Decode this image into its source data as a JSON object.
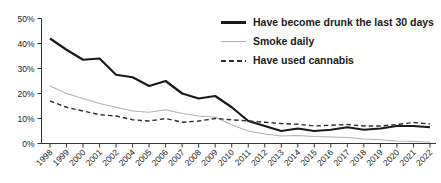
{
  "chart_data": {
    "type": "line",
    "title": "",
    "xlabel": "",
    "ylabel": "",
    "categories": [
      "1998",
      "1999",
      "2000",
      "2001",
      "2002",
      "2004",
      "2005",
      "2006",
      "2007",
      "2008",
      "2009",
      "2010",
      "2011",
      "2012",
      "2013",
      "2014",
      "2015",
      "2016",
      "2017",
      "2018",
      "2019",
      "2020",
      "2021",
      "2022"
    ],
    "series": [
      {
        "name": "Have become drunk the last 30 days",
        "style": "solid-thick",
        "color": "#1a1a1a",
        "values": [
          42,
          37.5,
          33.5,
          34,
          27.5,
          26.5,
          23,
          25,
          20,
          18,
          19,
          14.5,
          9,
          7,
          5,
          6,
          5,
          5.5,
          6.5,
          5.5,
          6,
          7,
          7,
          6.5
        ]
      },
      {
        "name": "Smoke daily",
        "style": "solid-thin",
        "color": "#b0b0b0",
        "values": [
          23,
          20,
          18,
          16,
          14.5,
          13,
          12.5,
          13.5,
          12,
          11,
          10.5,
          7.5,
          5,
          3.8,
          3,
          3.2,
          2.8,
          2.6,
          2.4,
          1.8,
          1.5,
          1,
          0.8,
          0.5
        ]
      },
      {
        "name": "Have used cannabis",
        "style": "dashed",
        "color": "#2e2e2e",
        "values": [
          17,
          14.5,
          13,
          11.5,
          11,
          9.5,
          9,
          10,
          8.5,
          9,
          10,
          9.5,
          9,
          8.5,
          8,
          7.7,
          7,
          7.3,
          7.6,
          7,
          7,
          7.6,
          8.4,
          7.8
        ]
      }
    ],
    "ylim": [
      0,
      50
    ],
    "y_ticks": [
      0,
      10,
      20,
      30,
      40,
      50
    ],
    "y_tick_suffix": "%",
    "grid": false,
    "legend_position": "top-right"
  },
  "colors": {
    "axis": "#333333",
    "tick_text": "#222222",
    "background": "#ffffff"
  }
}
